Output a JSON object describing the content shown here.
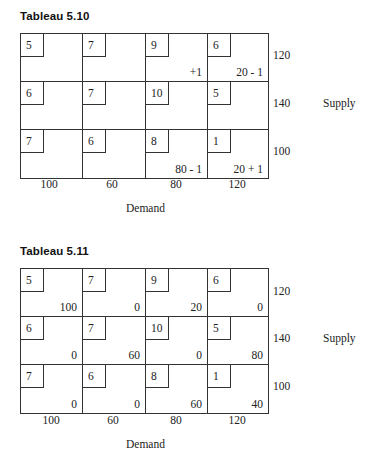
{
  "tableaus": [
    {
      "title": "Tableau 5.10",
      "rows": [
        {
          "supply": "120",
          "cells": [
            {
              "cost": "5",
              "value": ""
            },
            {
              "cost": "7",
              "value": ""
            },
            {
              "cost": "9",
              "value": "+1"
            },
            {
              "cost": "6",
              "value": "20 - 1"
            }
          ]
        },
        {
          "supply": "140",
          "cells": [
            {
              "cost": "6",
              "value": ""
            },
            {
              "cost": "7",
              "value": ""
            },
            {
              "cost": "10",
              "value": ""
            },
            {
              "cost": "5",
              "value": ""
            }
          ]
        },
        {
          "supply": "100",
          "cells": [
            {
              "cost": "7",
              "value": ""
            },
            {
              "cost": "6",
              "value": ""
            },
            {
              "cost": "8",
              "value": "80 - 1"
            },
            {
              "cost": "1",
              "value": "20 + 1"
            }
          ]
        }
      ],
      "demand": [
        "100",
        "60",
        "80",
        "120"
      ],
      "supply_label": "Supply",
      "demand_label": "Demand"
    },
    {
      "title": "Tableau 5.11",
      "rows": [
        {
          "supply": "120",
          "cells": [
            {
              "cost": "5",
              "value": "100"
            },
            {
              "cost": "7",
              "value": "0"
            },
            {
              "cost": "9",
              "value": "20"
            },
            {
              "cost": "6",
              "value": "0"
            }
          ]
        },
        {
          "supply": "140",
          "cells": [
            {
              "cost": "6",
              "value": "0"
            },
            {
              "cost": "7",
              "value": "60"
            },
            {
              "cost": "10",
              "value": "0"
            },
            {
              "cost": "5",
              "value": "80"
            }
          ]
        },
        {
          "supply": "100",
          "cells": [
            {
              "cost": "7",
              "value": "0"
            },
            {
              "cost": "6",
              "value": "0"
            },
            {
              "cost": "8",
              "value": "60"
            },
            {
              "cost": "1",
              "value": "40"
            }
          ]
        }
      ],
      "demand": [
        "100",
        "60",
        "80",
        "120"
      ],
      "supply_label": "Supply",
      "demand_label": "Demand"
    }
  ]
}
